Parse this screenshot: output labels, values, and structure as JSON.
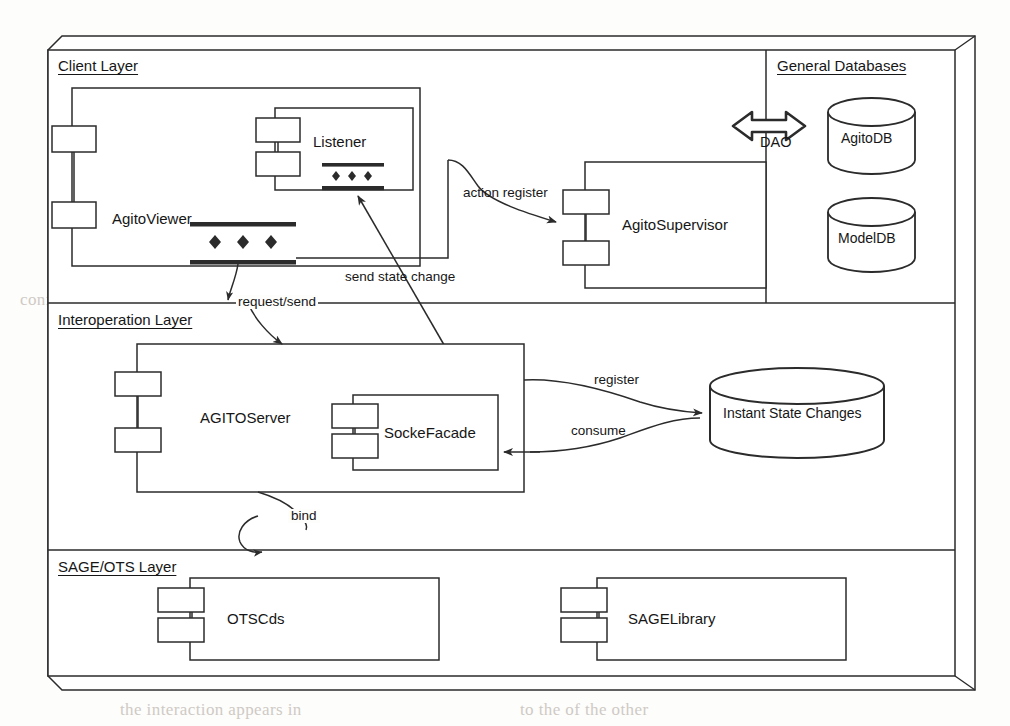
{
  "diagram": {
    "type": "uml-component-diagram",
    "stroke_color": "#2b2b2b",
    "fill_color": "#ffffff",
    "ghost_color": "#cfcac4"
  },
  "layers": [
    {
      "id": "client",
      "label": "Client Layer"
    },
    {
      "id": "interoperation",
      "label": "Interoperation Layer"
    },
    {
      "id": "sage_ots",
      "label": "SAGE/OTS Layer"
    }
  ],
  "partitions": [
    {
      "id": "general_databases",
      "label": "General Databases"
    }
  ],
  "components": [
    {
      "id": "agito_viewer",
      "label": "AgitoViewer",
      "layer": "client"
    },
    {
      "id": "listener",
      "label": "Listener",
      "layer": "client"
    },
    {
      "id": "agito_supervisor",
      "label": "AgitoSupervisor",
      "layer": "client"
    },
    {
      "id": "agito_server",
      "label": "AGITOServer",
      "layer": "interoperation"
    },
    {
      "id": "socke_facade",
      "label": "SockeFacade",
      "layer": "interoperation"
    },
    {
      "id": "otscds",
      "label": "OTSCds",
      "layer": "sage_ots"
    },
    {
      "id": "sage_library",
      "label": "SAGELibrary",
      "layer": "sage_ots"
    }
  ],
  "datastores": [
    {
      "id": "agito_db",
      "label": "AgitoDB",
      "partition": "general_databases"
    },
    {
      "id": "model_db",
      "label": "ModelDB",
      "partition": "general_databases"
    },
    {
      "id": "instant_state_changes",
      "label": "Instant State Changes",
      "layer": "interoperation"
    }
  ],
  "connectors": [
    {
      "id": "dao",
      "label": "DAO",
      "style": "bidirectional-block-arrow"
    },
    {
      "id": "action_register",
      "label": "action register",
      "style": "curved-arrow"
    },
    {
      "id": "send_state_change",
      "label": "send state change",
      "style": "straight-arrow"
    },
    {
      "id": "request_send",
      "label": "request/send",
      "style": "curved-arrow"
    },
    {
      "id": "register",
      "label": "register",
      "style": "curved-arrow"
    },
    {
      "id": "consume",
      "label": "consume",
      "style": "curved-arrow"
    },
    {
      "id": "bind",
      "label": "bind",
      "style": "curved-arrow"
    }
  ],
  "ghost_lines": [
    {
      "text": "reaching it as regular in real time",
      "x": 300,
      "y": 52
    },
    {
      "text": "at sequential multi-resolution has",
      "x": 420,
      "y": 80
    },
    {
      "text": "are the length of the glass",
      "x": 200,
      "y": 122
    },
    {
      "text": "on a grid following the of",
      "x": 420,
      "y": 152
    },
    {
      "text": "in the mouse as a interaction",
      "x": 430,
      "y": 180
    },
    {
      "text": "or being able to display in my",
      "x": 400,
      "y": 212
    },
    {
      "text": "table is also to be considered",
      "x": 350,
      "y": 244
    },
    {
      "text": "conference",
      "x": 20,
      "y": 290
    },
    {
      "text": "and in the case of combining one",
      "x": 60,
      "y": 318
    },
    {
      "text": "is all the mechanism",
      "x": 430,
      "y": 520
    },
    {
      "text": "considered in the general",
      "x": 80,
      "y": 518
    },
    {
      "text": "the interaction appears in",
      "x": 120,
      "y": 700
    },
    {
      "text": "to the of the other",
      "x": 520,
      "y": 700
    }
  ]
}
